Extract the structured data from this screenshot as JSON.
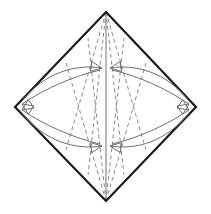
{
  "canvas": {
    "width": 211,
    "height": 214,
    "background": "#ffffff",
    "title": "Origami fold diagram — square base petal fold step"
  },
  "colors": {
    "outline": "#1a1a1a",
    "crease_dashed": "#8c8c8c",
    "center_line": "#9a9a9a",
    "arrow": "#6e6e6e",
    "background": "#ffffff"
  },
  "strokes": {
    "outline_width": 2.2,
    "dashed_width": 1.0,
    "center_width": 1.4,
    "arrow_width": 1.0,
    "dash_pattern": "4,3"
  },
  "vertices": {
    "top": {
      "x": 106,
      "y": 12,
      "label": "top-vertex"
    },
    "right": {
      "x": 196,
      "y": 107,
      "label": "right-vertex"
    },
    "bottom": {
      "x": 106,
      "y": 201,
      "label": "bottom-vertex"
    },
    "left": {
      "x": 15,
      "y": 107,
      "label": "left-vertex"
    }
  },
  "shape": {
    "name": "diamond-outline",
    "points": "106,12 196,107 106,201 15,107",
    "closed": true
  },
  "center_line": {
    "name": "vertical-center-crease",
    "x1": 106,
    "y1": 12,
    "x2": 106,
    "y2": 201
  },
  "convergence_points": {
    "upper": {
      "x": 106,
      "y": 68,
      "label": "upper-meet-point"
    },
    "lower": {
      "x": 106,
      "y": 146,
      "label": "lower-meet-point"
    }
  },
  "dashed_creases": [
    {
      "name": "crease-top-to-lower-left",
      "x1": 106,
      "y1": 12,
      "x2": 66,
      "y2": 150
    },
    {
      "name": "crease-top-to-lower-right",
      "x1": 106,
      "y1": 12,
      "x2": 146,
      "y2": 150
    },
    {
      "name": "crease-bottom-to-upper-left",
      "x1": 106,
      "y1": 201,
      "x2": 66,
      "y2": 63
    },
    {
      "name": "crease-bottom-to-upper-right",
      "x1": 106,
      "y1": 201,
      "x2": 146,
      "y2": 63
    },
    {
      "name": "crease-top-inner-left",
      "x1": 106,
      "y1": 12,
      "x2": 88,
      "y2": 175
    },
    {
      "name": "crease-top-inner-right",
      "x1": 106,
      "y1": 12,
      "x2": 124,
      "y2": 175
    },
    {
      "name": "crease-bottom-inner-left",
      "x1": 106,
      "y1": 201,
      "x2": 88,
      "y2": 38
    },
    {
      "name": "crease-bottom-inner-right",
      "x1": 106,
      "y1": 201,
      "x2": 124,
      "y2": 38
    }
  ],
  "curved_arrows": [
    {
      "name": "arrow-left-to-upper-center",
      "path": "M 22,101 C 45,72 76,64 102,68",
      "head_at": "end",
      "head_angle_deg": 8,
      "description": "left flap swings up to center"
    },
    {
      "name": "arrow-left-to-lower-center",
      "path": "M 22,113 C 45,142 76,150 102,146",
      "head_at": "end",
      "head_angle_deg": -8,
      "description": "left flap swings down to center"
    },
    {
      "name": "arrow-right-to-upper-center",
      "path": "M 189,101 C 166,72 136,64 110,68",
      "head_at": "end",
      "head_angle_deg": 172,
      "description": "right flap swings up to center"
    },
    {
      "name": "arrow-right-to-lower-center",
      "path": "M 189,113 C 166,142 136,150 110,146",
      "head_at": "end",
      "head_angle_deg": 188,
      "description": "right flap swings down to center"
    },
    {
      "name": "arrow-upper-center-to-left",
      "path": "M 100,70 C 74,76 46,88 22,104",
      "head_at": "end",
      "head_angle_deg": 214,
      "description": "return sweep toward left vertex"
    },
    {
      "name": "arrow-lower-center-to-left",
      "path": "M 100,144 C 74,138 46,126 22,110",
      "head_at": "end",
      "head_angle_deg": 146,
      "description": "return sweep toward left vertex"
    },
    {
      "name": "arrow-upper-center-to-right",
      "path": "M 112,70 C 138,76 165,88 189,104",
      "head_at": "end",
      "head_angle_deg": -34,
      "description": "return sweep toward right vertex"
    },
    {
      "name": "arrow-lower-center-to-right",
      "path": "M 112,144 C 138,138 165,126 189,110",
      "head_at": "end",
      "head_angle_deg": 34,
      "description": "return sweep toward right vertex"
    }
  ],
  "arrowheads": {
    "style": "open-triangle-outline",
    "length": 11,
    "half_width": 5
  }
}
